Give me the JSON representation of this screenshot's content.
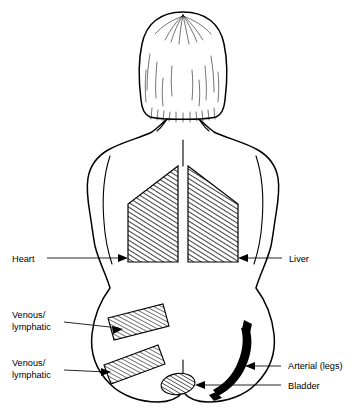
{
  "figure": {
    "view": "back view, standing figure with shoulder-length hair",
    "background_color": "#ffffff",
    "ink_color": "#000000",
    "caption_sliver": ""
  },
  "labels": {
    "heart": "Heart",
    "liver": "Liver",
    "venous_lymphatic_upper_line1": "Venous/",
    "venous_lymphatic_upper_line2": "lymphatic",
    "venous_lymphatic_lower_line1": "Venous/",
    "venous_lymphatic_lower_line2": "lymphatic",
    "arterial_legs": "Arterial (legs)",
    "bladder": "Bladder"
  },
  "regions": [
    {
      "name": "heart-region",
      "label": "Heart",
      "side": "left",
      "fill_style": "diagonal-hatch",
      "location": "upper-left back / thorax"
    },
    {
      "name": "liver-region",
      "label": "Liver",
      "side": "right",
      "fill_style": "diagonal-hatch",
      "location": "upper-right back / thorax"
    },
    {
      "name": "venous-lymphatic-upper-band",
      "label": "Venous/lymphatic",
      "side": "left",
      "fill_style": "parallel-stripes",
      "location": "left upper hip"
    },
    {
      "name": "venous-lymphatic-lower-band",
      "label": "Venous/lymphatic",
      "side": "left",
      "fill_style": "parallel-stripes",
      "location": "left lower hip"
    },
    {
      "name": "bladder-region",
      "label": "Bladder",
      "side": "center",
      "fill_style": "diagonal-hatch",
      "location": "lower center pelvis"
    },
    {
      "name": "arterial-legs-region",
      "label": "Arterial (legs)",
      "side": "right",
      "fill_style": "solid-stroke",
      "location": "right hip and thigh"
    }
  ]
}
